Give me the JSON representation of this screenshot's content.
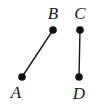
{
  "figure": {
    "type": "geometry-diagram",
    "background_color": "#ffffff",
    "stroke_color": "#1a1a1a",
    "point_fill_color": "#111111",
    "stroke_width": 1.4,
    "point_radius": 3.8,
    "label_font_size": 17,
    "canvas": {
      "width": 95,
      "height": 105
    },
    "points": [
      {
        "id": "A",
        "label": "A",
        "x": 22,
        "y": 77,
        "label_x": 16,
        "label_y": 92
      },
      {
        "id": "B",
        "label": "B",
        "x": 53,
        "y": 30,
        "label_x": 53,
        "label_y": 13
      },
      {
        "id": "C",
        "label": "C",
        "x": 80,
        "y": 30,
        "label_x": 80,
        "label_y": 13
      },
      {
        "id": "D",
        "label": "D",
        "x": 79,
        "y": 77,
        "label_x": 79,
        "label_y": 93
      }
    ],
    "segments": [
      {
        "id": "AB",
        "from": "A",
        "to": "B",
        "x1": 22,
        "y1": 77,
        "x2": 53,
        "y2": 30
      },
      {
        "id": "CD",
        "from": "C",
        "to": "D",
        "x1": 80,
        "y1": 30,
        "x2": 79,
        "y2": 77
      }
    ]
  }
}
